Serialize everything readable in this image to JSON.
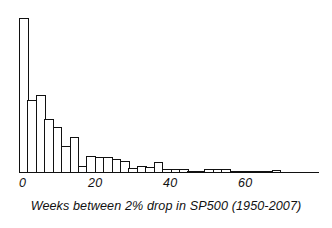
{
  "chart_data": {
    "type": "bar",
    "title": "",
    "subtitle": "",
    "xlabel": "Weeks between 2% drop in SP500 (1950-2007)",
    "ylabel": "",
    "grid": false,
    "legend": null,
    "axis": {
      "x_tick_values": [
        0,
        20,
        40,
        60
      ],
      "x_tick_labels": [
        "0",
        "20",
        "40",
        "60"
      ],
      "xlim": [
        0,
        78
      ],
      "ylim": [
        0,
        160
      ],
      "y_axis_visible": false,
      "x_axis_visible": true
    },
    "bin_width": 2.5,
    "bin_starts": [
      0,
      2.5,
      5,
      7.5,
      10,
      12.5,
      15,
      17.5,
      20,
      22.5,
      25,
      27.5,
      30,
      32.5,
      35,
      37.5,
      40,
      42.5,
      45,
      47.5,
      50,
      52.5,
      55,
      57.5,
      60,
      62.5,
      65,
      67.5,
      70,
      72.5,
      75
    ],
    "categories": [
      "0-2.5",
      "2.5-5",
      "5-7.5",
      "7.5-10",
      "10-12.5",
      "12.5-15",
      "15-17.5",
      "17.5-20",
      "20-22.5",
      "22.5-25",
      "25-27.5",
      "27.5-30",
      "30-32.5",
      "32.5-35",
      "35-37.5",
      "37.5-40",
      "40-42.5",
      "42.5-45",
      "45-47.5",
      "47.5-50",
      "50-52.5",
      "52.5-55",
      "55-57.5",
      "57.5-60",
      "60-62.5",
      "62.5-65",
      "65-67.5",
      "67.5-70",
      "70-72.5",
      "72.5-75",
      "75-77.5"
    ],
    "values": [
      156,
      73,
      78,
      54,
      46,
      26,
      35,
      6,
      16,
      15,
      15,
      13,
      11,
      4,
      6,
      5,
      10,
      3,
      3,
      3,
      1,
      1,
      3,
      3,
      3,
      1,
      0,
      0,
      0,
      0,
      2
    ]
  },
  "tick_labels": [
    {
      "text": "0",
      "x_px": 19
    },
    {
      "text": "20",
      "x_px": 88
    },
    {
      "text": "40",
      "x_px": 163
    },
    {
      "text": "60",
      "x_px": 238
    }
  ],
  "caption": {
    "text": "Weeks between 2% drop in SP500 (1950-2007)"
  },
  "style": {
    "bar_fill": "#ffffff",
    "bar_stroke": "#111111",
    "axis_color": "#111111",
    "text_color": "#111111",
    "background": "#ffffff"
  }
}
